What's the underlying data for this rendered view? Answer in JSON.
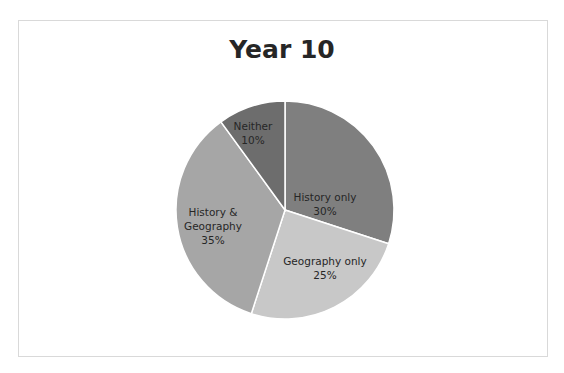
{
  "chart_data": {
    "type": "pie",
    "title": "Year 10",
    "categories": [
      "History only",
      "Geography only",
      "History & Geography",
      "Neither"
    ],
    "values": [
      30,
      25,
      35,
      10
    ],
    "labels": [
      "History only\n30%",
      "Geography only\n25%",
      "History &\nGeography\n35%",
      "Neither\n10%"
    ],
    "colors": [
      "#7f7f7f",
      "#c8c8c8",
      "#a6a6a6",
      "#6d6d6d"
    ],
    "start_angle_deg": 0,
    "direction": "clockwise",
    "legend": "none"
  },
  "slices": [
    {
      "name": "History only",
      "pct": "30%"
    },
    {
      "name": "Geography only",
      "pct": "25%"
    },
    {
      "name1": "History &",
      "name2": "Geography",
      "pct": "35%"
    },
    {
      "name": "Neither",
      "pct": "10%"
    }
  ]
}
